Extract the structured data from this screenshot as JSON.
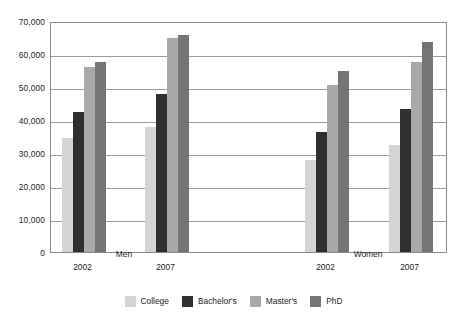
{
  "chart_data": {
    "type": "bar",
    "title": "",
    "subtitle": "",
    "xlabel": "",
    "ylabel": "",
    "ylim": [
      0,
      70000
    ],
    "ytick_step": 10000,
    "ytick_labels": [
      "0",
      "10,000",
      "20,000",
      "30,000",
      "40,000",
      "50,000",
      "60,000",
      "70,000"
    ],
    "ytick_values": [
      0,
      10000,
      20000,
      30000,
      40000,
      50000,
      60000,
      70000
    ],
    "grid": true,
    "grid_axis": "y",
    "legend_position": "bottom",
    "categories": [
      "2002",
      "2007",
      "2002",
      "2007"
    ],
    "group_labels": [
      "Men",
      "Women"
    ],
    "groups": [
      {
        "group": "Men",
        "year": "2002",
        "values": [
          34500,
          42300,
          56000,
          57700
        ]
      },
      {
        "group": "Men",
        "year": "2007",
        "values": [
          37800,
          48000,
          65000,
          65800
        ]
      },
      {
        "group": "Women",
        "year": "2002",
        "values": [
          28000,
          36500,
          50500,
          55000
        ]
      },
      {
        "group": "Women",
        "year": "2007",
        "values": [
          32500,
          43300,
          57600,
          63500
        ]
      }
    ],
    "series": [
      {
        "name": "College",
        "color": "#d4d4d4",
        "values": [
          34500,
          37800,
          28000,
          32500
        ]
      },
      {
        "name": "Bachelor's",
        "color": "#2f2f2f",
        "values": [
          42300,
          48000,
          36500,
          43300
        ]
      },
      {
        "name": "Master's",
        "color": "#a9a9a9",
        "values": [
          56000,
          65000,
          50500,
          57600
        ]
      },
      {
        "name": "PhD",
        "color": "#757575",
        "values": [
          57700,
          65800,
          55000,
          63500
        ]
      }
    ],
    "legend": [
      {
        "label": "College",
        "color": "#d4d4d4"
      },
      {
        "label": "Bachelor's",
        "color": "#2f2f2f"
      },
      {
        "label": "Master's",
        "color": "#a9a9a9"
      },
      {
        "label": "PhD",
        "color": "#757575"
      }
    ]
  },
  "layout": {
    "plot_left": 50,
    "plot_top": 22,
    "plot_width": 397,
    "plot_height": 231,
    "group_centers": [
      82.5,
      165.5,
      325.5,
      409.5
    ],
    "group_label_centers": [
      124,
      368
    ],
    "bar_width": 11,
    "bar_gap": 0,
    "year_label_y": 262,
    "group_label_y": 249
  }
}
